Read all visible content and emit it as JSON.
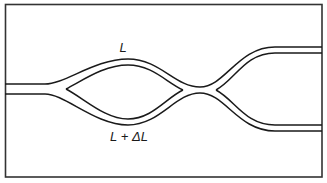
{
  "diagram": {
    "type": "Mach-Zehnder interferometer waveguide",
    "labels": {
      "upper_arm": "L",
      "lower_arm": "L + ΔL"
    },
    "colors": {
      "line": "#1a1a1a",
      "frame": "#333333",
      "background": "#ffffff"
    }
  }
}
